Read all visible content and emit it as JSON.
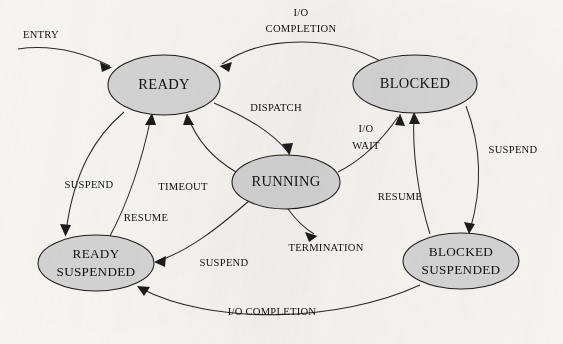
{
  "diagram": {
    "type": "state-transition-diagram",
    "background_color": "#f7f6f3",
    "node_fill_color": "#d5d5d5",
    "node_stroke_color": "#1c1c1c",
    "edge_color": "#2a2a2a",
    "text_color": "#111111",
    "states": [
      {
        "id": "ready",
        "label": "READY",
        "label_line1": "READY",
        "label_line2": "",
        "cx": 164,
        "cy": 85,
        "rx": 56,
        "ry": 30
      },
      {
        "id": "blocked",
        "label": "BLOCKED",
        "label_line1": "BLOCKED",
        "label_line2": "",
        "cx": 415,
        "cy": 84,
        "rx": 62,
        "ry": 29
      },
      {
        "id": "running",
        "label": "RUNNING",
        "label_line1": "RUNNING",
        "label_line2": "",
        "cx": 286,
        "cy": 182,
        "rx": 54,
        "ry": 27
      },
      {
        "id": "ready-suspended",
        "label": "READY SUSPENDED",
        "label_line1": "READY",
        "label_line2": "SUSPENDED",
        "cx": 96,
        "cy": 263,
        "rx": 58,
        "ry": 28
      },
      {
        "id": "blocked-suspended",
        "label": "BLOCKED SUSPENDED",
        "label_line1": "BLOCKED",
        "label_line2": "SUSPENDED",
        "cx": 461,
        "cy": 261,
        "rx": 58,
        "ry": 28
      }
    ],
    "transitions": [
      {
        "id": "entry",
        "label": "ENTRY",
        "label_line1": "ENTRY",
        "label_line2": "",
        "from": "",
        "to": "ready"
      },
      {
        "id": "io-completion-blocked-ready",
        "label": "I/O COMPLETION",
        "label_line1": "I/O",
        "label_line2": "COMPLETION",
        "from": "blocked",
        "to": "ready"
      },
      {
        "id": "dispatch",
        "label": "DISPATCH",
        "label_line1": "DISPATCH",
        "label_line2": "",
        "from": "ready",
        "to": "running"
      },
      {
        "id": "timeout",
        "label": "TIMEOUT",
        "label_line1": "TIMEOUT",
        "label_line2": "",
        "from": "running",
        "to": "ready"
      },
      {
        "id": "io-wait",
        "label": "I/O WAIT",
        "label_line1": "I/O",
        "label_line2": "WAIT",
        "from": "running",
        "to": "blocked"
      },
      {
        "id": "termination",
        "label": "TERMINATION",
        "label_line1": "TERMINATION",
        "label_line2": "",
        "from": "running",
        "to": ""
      },
      {
        "id": "suspend-ready",
        "label": "SUSPEND",
        "label_line1": "SUSPEND",
        "label_line2": "",
        "from": "ready",
        "to": "ready-suspended"
      },
      {
        "id": "resume-ready",
        "label": "RESUME",
        "label_line1": "RESUME",
        "label_line2": "",
        "from": "ready-suspended",
        "to": "ready"
      },
      {
        "id": "suspend-running",
        "label": "SUSPEND",
        "label_line1": "SUSPEND",
        "label_line2": "",
        "from": "running",
        "to": "ready-suspended"
      },
      {
        "id": "suspend-blocked",
        "label": "SUSPEND",
        "label_line1": "SUSPEND",
        "label_line2": "",
        "from": "blocked",
        "to": "blocked-suspended"
      },
      {
        "id": "resume-blocked",
        "label": "RESUME",
        "label_line1": "RESUME",
        "label_line2": "",
        "from": "blocked-suspended",
        "to": "blocked"
      },
      {
        "id": "io-completion-suspended",
        "label": "I/O COMPLETION",
        "label_line1": "I/O COMPLETION",
        "label_line2": "",
        "from": "blocked-suspended",
        "to": "ready-suspended"
      }
    ]
  }
}
